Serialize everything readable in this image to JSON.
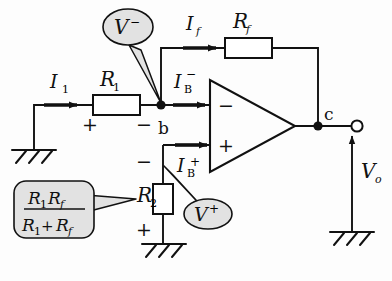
{
  "figure": {
    "background_color": "#fdfdfd",
    "line_color": "#111111",
    "callout_fill": "#e2e2e2"
  },
  "labels": {
    "current_input": "I",
    "current_input_sub": "1",
    "current_feedback": "I",
    "current_feedback_sub": "f",
    "resistor_input": "R",
    "resistor_input_sub": "1",
    "resistor_feedback": "R",
    "resistor_feedback_sub": "f",
    "resistor_bias": "R",
    "resistor_bias_sub": "2",
    "bias_current_minus": "I",
    "bias_current_minus_sub": "B",
    "bias_current_minus_sup": "−",
    "bias_current_plus": "I",
    "bias_current_plus_sub": "B",
    "bias_current_plus_sup": "+",
    "node_b": "b",
    "node_c": "c",
    "output_voltage": "V",
    "output_voltage_sub": "o",
    "opamp_inverting": "−",
    "opamp_noninverting": "+",
    "polarity_r1_plus": "+",
    "polarity_r1_minus": "−",
    "polarity_r2_plus": "+",
    "polarity_r2_minus": "−"
  },
  "callouts": {
    "v_minus": {
      "symbol": "V",
      "superscript": "−",
      "shape": "ellipse"
    },
    "v_plus": {
      "symbol": "V",
      "superscript": "+",
      "shape": "ellipse"
    },
    "r2_value": {
      "numerator_a": "R",
      "numerator_a_sub": "1",
      "numerator_b": "R",
      "numerator_b_sub": "f",
      "denominator_a": "R",
      "denominator_a_sub": "1",
      "denominator_plus": "+",
      "denominator_b": "R",
      "denominator_b_sub": "f",
      "shape": "rounded-rect"
    }
  },
  "components": {
    "ground_input": "ground-symbol",
    "ground_bias": "ground-symbol",
    "ground_output": "ground-symbol",
    "output_terminal": "open-circle-terminal",
    "node_dot_inverting": "junction-dot",
    "node_dot_output": "junction-dot",
    "opamp": "triangle-amplifier"
  }
}
